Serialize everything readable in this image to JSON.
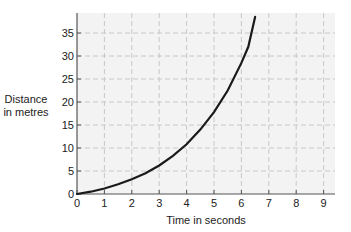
{
  "chart_data": {
    "type": "line",
    "title": "",
    "xlabel": "Time in seconds",
    "ylabel": "Distance in metres",
    "ylabel_lines": [
      "Distance",
      "in metres"
    ],
    "xlim": [
      0,
      9.4
    ],
    "ylim": [
      0,
      39
    ],
    "xticks": [
      0,
      1,
      2,
      3,
      4,
      5,
      6,
      7,
      8,
      9
    ],
    "yticks": [
      0,
      5,
      10,
      15,
      20,
      25,
      30,
      35
    ],
    "grid": true,
    "grid_style": "dashed",
    "legend": null,
    "series": [
      {
        "name": "distance",
        "color": "#1a1a1a",
        "x": [
          0,
          0.5,
          1,
          1.5,
          2,
          2.5,
          3,
          3.5,
          4,
          4.5,
          5,
          5.5,
          6,
          6.25,
          6.5
        ],
        "y": [
          0,
          0.5,
          1.2,
          2.1,
          3.2,
          4.5,
          6.2,
          8.3,
          10.8,
          14,
          17.8,
          22.5,
          28.5,
          32,
          38.5
        ]
      }
    ]
  },
  "colors": {
    "plot_background": "#f3f3f3",
    "gridline": "#c8c8c8",
    "axis": "#555555",
    "curve": "#1a1a1a"
  }
}
